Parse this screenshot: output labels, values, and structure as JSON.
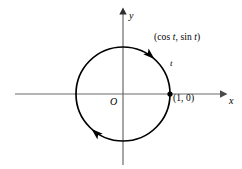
{
  "figure": {
    "name": "unit-circle-parametrization",
    "width": 242,
    "height": 169,
    "background_color": "#ffffff",
    "stroke_color": "#000000",
    "axis_color": "#6b6b6b"
  },
  "axes": {
    "x_label": "x",
    "y_label": "y",
    "origin_label": "O",
    "x_axis": {
      "x1": 15,
      "y1": 94,
      "x2": 228,
      "y2": 94,
      "arrow": "right"
    },
    "y_axis": {
      "x1": 123,
      "y1": 165,
      "x2": 123,
      "y2": 10,
      "arrow": "up"
    }
  },
  "circle": {
    "center_x": 123,
    "center_y": 94,
    "radius": 47,
    "stroke_width": 1.7,
    "direction": "counterclockwise"
  },
  "points": [
    {
      "name": "unit-point",
      "label": "(1, 0)",
      "x": 170,
      "y": 94,
      "marker": "dot"
    }
  ],
  "annotations": {
    "parametric_point_prefix": "(cos ",
    "parametric_point_var1": "t",
    "parametric_point_middle": ", sin ",
    "parametric_point_var2": "t",
    "parametric_point_suffix": ")",
    "parametric_point_full": "(cos t, sin t)",
    "parameter_label": "t"
  },
  "arrows": [
    {
      "name": "arc-arrow-upper-right",
      "angle_deg": 48,
      "direction": "counterclockwise"
    },
    {
      "name": "arc-arrow-lower-left",
      "angle_deg": 228,
      "direction": "counterclockwise"
    }
  ]
}
